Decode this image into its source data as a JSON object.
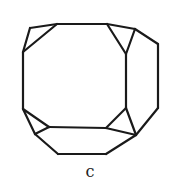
{
  "figure": {
    "label": "c",
    "stroke_color": "#1a1a1a",
    "vertices": {
      "A": [
        30,
        28
      ],
      "B": [
        57,
        24
      ],
      "C": [
        107,
        24
      ],
      "D": [
        135,
        29
      ],
      "E": [
        158,
        44
      ],
      "F": [
        158,
        108
      ],
      "G": [
        136,
        135
      ],
      "H": [
        106,
        154
      ],
      "I": [
        58,
        154
      ],
      "J": [
        35,
        134
      ],
      "K": [
        23,
        109
      ],
      "L": [
        23,
        52
      ],
      "M": [
        126,
        54
      ],
      "N": [
        126,
        108
      ],
      "O": [
        106,
        128
      ],
      "P": [
        49,
        127
      ]
    },
    "edges": [
      [
        "A",
        "B"
      ],
      [
        "B",
        "C"
      ],
      [
        "C",
        "D"
      ],
      [
        "D",
        "E"
      ],
      [
        "E",
        "F"
      ],
      [
        "F",
        "G"
      ],
      [
        "G",
        "H"
      ],
      [
        "H",
        "I"
      ],
      [
        "I",
        "J"
      ],
      [
        "J",
        "K"
      ],
      [
        "K",
        "L"
      ],
      [
        "L",
        "A"
      ],
      [
        "L",
        "B"
      ],
      [
        "C",
        "M"
      ],
      [
        "D",
        "M"
      ],
      [
        "M",
        "N"
      ],
      [
        "N",
        "O"
      ],
      [
        "N",
        "G"
      ],
      [
        "O",
        "G"
      ],
      [
        "O",
        "P"
      ],
      [
        "P",
        "K"
      ],
      [
        "P",
        "J"
      ]
    ]
  }
}
